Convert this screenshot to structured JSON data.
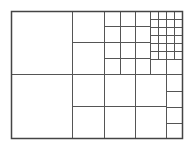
{
  "diagram": {
    "type": "recursive-grid-subdivision",
    "background": "#ffffff",
    "line_color": "#555555",
    "outer_color": "#444444",
    "outer": {
      "x": 11,
      "y": 11,
      "w": 171,
      "h": 127
    },
    "cells": [
      {
        "x": 11,
        "y": 11,
        "w": 61,
        "h": 63
      },
      {
        "x": 11,
        "y": 74,
        "w": 61,
        "h": 64
      },
      {
        "x": 72,
        "y": 11,
        "w": 32,
        "h": 31
      },
      {
        "x": 72,
        "y": 42,
        "w": 32,
        "h": 32
      },
      {
        "x": 104,
        "y": 11,
        "w": 16,
        "h": 15
      },
      {
        "x": 120,
        "y": 11,
        "w": 15,
        "h": 15
      },
      {
        "x": 135,
        "y": 11,
        "w": 15,
        "h": 15
      },
      {
        "x": 104,
        "y": 26,
        "w": 16,
        "h": 16
      },
      {
        "x": 120,
        "y": 26,
        "w": 15,
        "h": 16
      },
      {
        "x": 135,
        "y": 26,
        "w": 15,
        "h": 16
      },
      {
        "x": 104,
        "y": 42,
        "w": 16,
        "h": 16
      },
      {
        "x": 120,
        "y": 42,
        "w": 15,
        "h": 16
      },
      {
        "x": 135,
        "y": 42,
        "w": 15,
        "h": 16
      },
      {
        "x": 104,
        "y": 58,
        "w": 16,
        "h": 16
      },
      {
        "x": 120,
        "y": 58,
        "w": 15,
        "h": 16
      },
      {
        "x": 135,
        "y": 58,
        "w": 15,
        "h": 16
      },
      {
        "x": 150,
        "y": 59,
        "w": 16,
        "h": 15
      },
      {
        "x": 166,
        "y": 59,
        "w": 16,
        "h": 15
      },
      {
        "x": 72,
        "y": 74,
        "w": 32,
        "h": 32
      },
      {
        "x": 104,
        "y": 74,
        "w": 31,
        "h": 32
      },
      {
        "x": 135,
        "y": 74,
        "w": 31,
        "h": 32
      },
      {
        "x": 72,
        "y": 106,
        "w": 32,
        "h": 32
      },
      {
        "x": 104,
        "y": 106,
        "w": 31,
        "h": 32
      },
      {
        "x": 135,
        "y": 106,
        "w": 31,
        "h": 32
      },
      {
        "x": 166,
        "y": 74,
        "w": 16,
        "h": 17
      },
      {
        "x": 166,
        "y": 91,
        "w": 16,
        "h": 16
      },
      {
        "x": 166,
        "y": 107,
        "w": 16,
        "h": 16
      },
      {
        "x": 166,
        "y": 123,
        "w": 16,
        "h": 15
      }
    ],
    "fine_grid": {
      "x": 150,
      "y": 11,
      "cols": 4,
      "rows": 6,
      "cell_w": 8,
      "cell_h": 8
    }
  }
}
